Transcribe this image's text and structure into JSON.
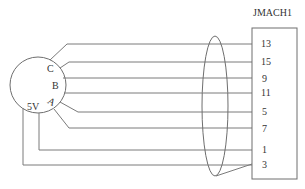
{
  "diagram": {
    "type": "wiring-diagram",
    "connector": {
      "title": "JMACH1",
      "pins": [
        "13",
        "15",
        "9",
        "11",
        "5",
        "7",
        "1",
        "3"
      ]
    },
    "sensor": {
      "labels": {
        "c": "C",
        "b": "B",
        "a": "A",
        "v5": "5V"
      }
    },
    "shield": "shielded cable bundle",
    "colors": {
      "line": "#7a7a7a",
      "text": "#333333"
    }
  }
}
